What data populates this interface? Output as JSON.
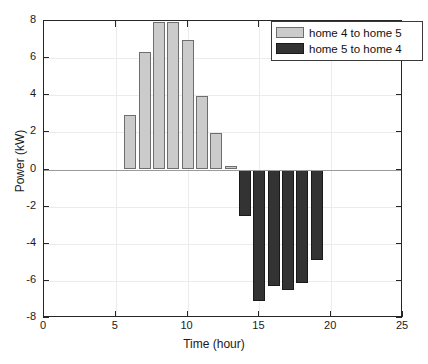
{
  "chart_data": {
    "type": "bar",
    "title": "",
    "xlabel": "Time (hour)",
    "ylabel": "Power (kW)",
    "xlim": [
      0,
      25
    ],
    "ylim": [
      -8,
      8
    ],
    "xticks": [
      0,
      5,
      10,
      15,
      20,
      25
    ],
    "yticks": [
      8,
      6,
      4,
      2,
      0,
      -2,
      -4,
      -6,
      -8
    ],
    "xtick_labels": [
      "0",
      "5",
      "10",
      "15",
      "20",
      "25"
    ],
    "ytick_labels": [
      "8",
      "6",
      "4",
      "2",
      "0",
      "-2",
      "-4",
      "-6",
      "-8"
    ],
    "grid": true,
    "legend_position": "top-right",
    "legend": [
      {
        "label": "home 4 to home 5",
        "color": "#cbcbcb"
      },
      {
        "label": "home 5 to home 4",
        "color": "#333333"
      }
    ],
    "series": [
      {
        "name": "home 4 to home 5",
        "color": "#cbcbcb",
        "points": [
          {
            "x": 6,
            "y": 2.95
          },
          {
            "x": 7,
            "y": 6.35
          },
          {
            "x": 8,
            "y": 7.95
          },
          {
            "x": 9,
            "y": 7.95
          },
          {
            "x": 10,
            "y": 6.95
          },
          {
            "x": 11,
            "y": 3.95
          },
          {
            "x": 12,
            "y": 1.95
          },
          {
            "x": 13,
            "y": 0.2
          }
        ]
      },
      {
        "name": "home 5 to home 4",
        "color": "#333333",
        "points": [
          {
            "x": 14,
            "y": -2.5
          },
          {
            "x": 15,
            "y": -7.1
          },
          {
            "x": 16,
            "y": -6.3
          },
          {
            "x": 17,
            "y": -6.5
          },
          {
            "x": 18,
            "y": -6.1
          },
          {
            "x": 19,
            "y": -4.9
          }
        ]
      }
    ]
  }
}
